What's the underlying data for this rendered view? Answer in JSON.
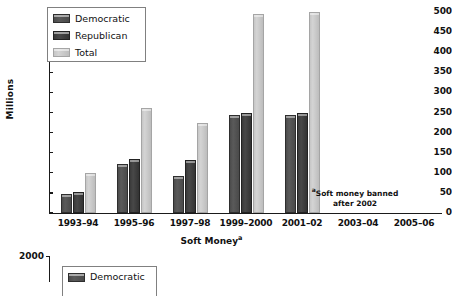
{
  "chart_data": {
    "type": "bar",
    "title": "",
    "xlabel": "Soft Money",
    "xlabel_superscript": "a",
    "ylabel": "Millions",
    "ylim": [
      0,
      500
    ],
    "ytick_step": 50,
    "grid": false,
    "legend_position": "upper-left-inside",
    "categories": [
      "1993–94",
      "1995–96",
      "1997–98",
      "1999–2000",
      "2001–02",
      "2003–04",
      "2005–06"
    ],
    "ytick_labels": [
      "500",
      "450",
      "400",
      "350",
      "300",
      "250",
      "200",
      "150",
      "100",
      "50",
      "0"
    ],
    "series": [
      {
        "name": "Democratic",
        "color": "#4f4f4f",
        "values": [
          48,
          123,
          92,
          245,
          245,
          null,
          null
        ]
      },
      {
        "name": "Republican",
        "color": "#3b3b3b",
        "values": [
          51,
          134,
          131,
          248,
          250,
          null,
          null
        ]
      },
      {
        "name": "Total",
        "color": "#c9c9c9",
        "values": [
          100,
          262,
          224,
          495,
          500,
          null,
          null
        ]
      }
    ],
    "annotations": [
      {
        "superscript": "a",
        "line1": "Soft money banned",
        "line2": "after 2002"
      }
    ]
  },
  "legend": {
    "items": [
      {
        "label": "Democratic"
      },
      {
        "label": "Republican"
      },
      {
        "label": "Total"
      }
    ]
  },
  "second_chart": {
    "ytick_label": "2000",
    "legend_item_partial": "Democratic"
  }
}
